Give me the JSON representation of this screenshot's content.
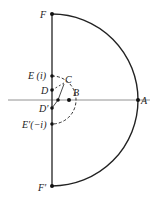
{
  "diagram": {
    "type": "contour",
    "labels": {
      "F": "F",
      "F_prime": "F′",
      "A": "A",
      "B": "B",
      "C": "C",
      "D": "D",
      "D_prime": "D′",
      "E": "E (i)",
      "E_prime": "E′(−i)"
    },
    "colors": {
      "stroke": "#222222",
      "axis": "#666666"
    }
  }
}
